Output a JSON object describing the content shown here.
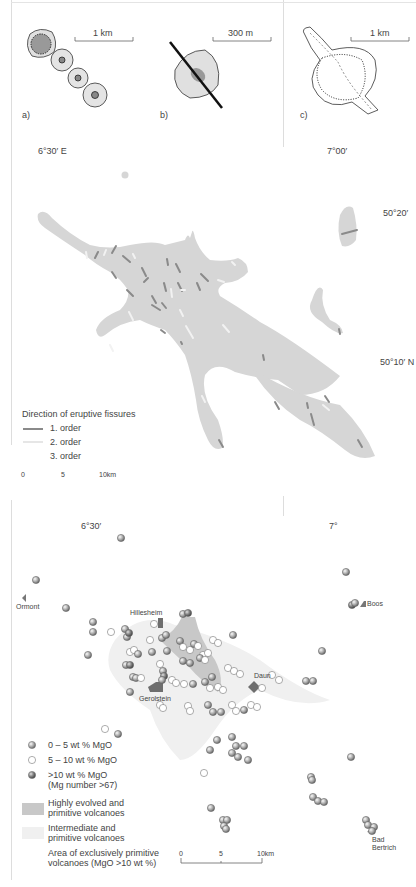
{
  "panel_top": {
    "a": {
      "label": "a)",
      "scale": "1 km"
    },
    "b": {
      "label": "b)",
      "scale": "300 m"
    },
    "c": {
      "label": "c)",
      "scale": "1 km"
    }
  },
  "map_middle": {
    "lon_left": "6°30′ E",
    "lon_right": "7°00′",
    "lat_top": "50°20′",
    "lat_bottom": "50°10′ N",
    "legend": {
      "title": "Direction of eruptive fissures",
      "items": [
        {
          "label": "1. order",
          "color": "#8a8a8a"
        },
        {
          "label": "2. order",
          "color": "#e6e6e6"
        },
        {
          "label": "3. order",
          "color": "#ffffff"
        }
      ]
    },
    "scalebar": {
      "ticks": [
        "0",
        "5",
        "10km"
      ]
    },
    "field_color": "#d6d6d6"
  },
  "map_bottom": {
    "lon_left": "6°30′",
    "lon_right": "7°",
    "places": {
      "ormont": "Ormont",
      "hillesheim": "Hillesheim",
      "gerolstein": "Gerolstein",
      "daun": "Daun",
      "boos": "Boos",
      "bad_bertrich_1": "Bad",
      "bad_bertrich_2": "Bertrich"
    },
    "legend": {
      "dots": [
        {
          "label": "0 – 5  wt % MgO",
          "kind": "grey"
        },
        {
          "label": "5 – 10 wt % MgO",
          "kind": "white"
        },
        {
          "label": ">10  wt % MgO",
          "sub": "(Mg number >67)",
          "kind": "dark"
        }
      ],
      "areas": [
        {
          "line1": "Highly evolved and",
          "line2": "primitive volcanoes",
          "color": "#c8c8c8"
        },
        {
          "line1": "Intermediate and",
          "line2": "primitive volcanoes",
          "color": "#ececec"
        },
        {
          "line1": "Area of exclusively primitive",
          "line2": "volcanoes (MgO >10 wt %)",
          "color": "#ffffff"
        }
      ]
    },
    "scalebar": {
      "ticks": [
        "0",
        "5",
        "10km"
      ]
    }
  }
}
